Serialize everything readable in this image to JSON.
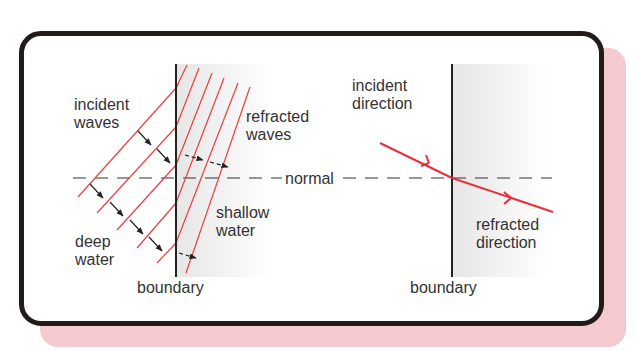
{
  "colors": {
    "frame_border": "#231a1a",
    "shadow": "#f4c9cf",
    "wave_line": "#e8403e",
    "ray": "#e8303a",
    "boundary": "#222222",
    "shallow_shade": "#ececec",
    "text": "#333333"
  },
  "left_panel": {
    "incident_label": "incident\nwaves",
    "refracted_label": "refracted\nwaves",
    "shallow_label": "shallow\nwater",
    "deep_label": "deep\nwater",
    "boundary_label": "boundary"
  },
  "normal_label": "normal",
  "right_panel": {
    "incident_label": "incident\ndirection",
    "refracted_label": "refracted\ndirection",
    "boundary_label": "boundary"
  }
}
